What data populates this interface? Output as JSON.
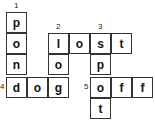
{
  "puzzle": {
    "cells": [
      {
        "row": 0,
        "col": 0,
        "letter": "p"
      },
      {
        "row": 1,
        "col": 0,
        "letter": "o"
      },
      {
        "row": 2,
        "col": 0,
        "letter": "n"
      },
      {
        "row": 3,
        "col": 0,
        "letter": "d"
      },
      {
        "row": 3,
        "col": 1,
        "letter": "o"
      },
      {
        "row": 3,
        "col": 2,
        "letter": "g"
      },
      {
        "row": 1,
        "col": 2,
        "letter": "l"
      },
      {
        "row": 2,
        "col": 2,
        "letter": "o"
      },
      {
        "row": 1,
        "col": 3,
        "letter": "o"
      },
      {
        "row": 1,
        "col": 4,
        "letter": "s"
      },
      {
        "row": 1,
        "col": 5,
        "letter": "t"
      },
      {
        "row": 2,
        "col": 4,
        "letter": "p"
      },
      {
        "row": 3,
        "col": 4,
        "letter": "o"
      },
      {
        "row": 3,
        "col": 5,
        "letter": "f"
      },
      {
        "row": 3,
        "col": 6,
        "letter": "f"
      },
      {
        "row": 4,
        "col": 4,
        "letter": "t"
      }
    ],
    "numbers": [
      {
        "label": "1",
        "row": 0,
        "col": 0,
        "pos": "above"
      },
      {
        "label": "2",
        "row": 1,
        "col": 2,
        "pos": "above"
      },
      {
        "label": "3",
        "row": 1,
        "col": 4,
        "pos": "above"
      },
      {
        "label": "4",
        "row": 3,
        "col": 0,
        "pos": "left"
      },
      {
        "label": "5",
        "row": 3,
        "col": 4,
        "pos": "left"
      }
    ],
    "words": [
      {
        "number": "1",
        "direction": "down",
        "answer": "pond"
      },
      {
        "number": "2",
        "direction": "across",
        "answer": "lost"
      },
      {
        "number": "2",
        "direction": "down",
        "answer": "log"
      },
      {
        "number": "3",
        "direction": "down",
        "answer": "spot"
      },
      {
        "number": "4",
        "direction": "across",
        "answer": "dog"
      },
      {
        "number": "5",
        "direction": "across",
        "answer": "off"
      }
    ]
  }
}
